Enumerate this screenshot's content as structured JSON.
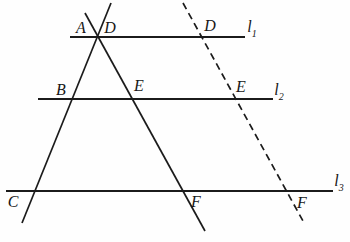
{
  "figure": {
    "type": "geometry-diagram",
    "background": "#fefefe",
    "stroke_color": "#1b1b1b",
    "dash_pattern": "7,4.5",
    "width": 350,
    "height": 242,
    "lines": [
      {
        "name": "line-l1",
        "x1": 70,
        "y1": 37,
        "x2": 245,
        "y2": 37,
        "dashed": false,
        "stroke_width": 2
      },
      {
        "name": "line-l2",
        "x1": 38,
        "y1": 99,
        "x2": 273,
        "y2": 99,
        "dashed": false,
        "stroke_width": 2
      },
      {
        "name": "line-l3",
        "x1": 6,
        "y1": 191,
        "x2": 333,
        "y2": 191,
        "dashed": false,
        "stroke_width": 2
      },
      {
        "name": "transversal-a-b-c",
        "x1": 111,
        "y1": 3,
        "x2": 22,
        "y2": 223,
        "dashed": false,
        "stroke_width": 1.7
      },
      {
        "name": "transversal-a-e-f",
        "x1": 85,
        "y1": 13,
        "x2": 205,
        "y2": 231,
        "dashed": false,
        "stroke_width": 1.7
      },
      {
        "name": "transversal-d-e-f-dashed",
        "x1": 183,
        "y1": 3,
        "x2": 303,
        "y2": 221,
        "dashed": true,
        "stroke_width": 1.7
      }
    ],
    "point_labels": [
      {
        "name": "point-label-a",
        "text": "A",
        "x": 81,
        "y": 28
      },
      {
        "name": "point-label-d-left",
        "text": "D",
        "x": 110,
        "y": 28
      },
      {
        "name": "point-label-d-dashed",
        "text": "D",
        "x": 210,
        "y": 26
      },
      {
        "name": "point-label-b",
        "text": "B",
        "x": 61,
        "y": 90
      },
      {
        "name": "point-label-e-solid",
        "text": "E",
        "x": 139,
        "y": 86
      },
      {
        "name": "point-label-e-dashed",
        "text": "E",
        "x": 241,
        "y": 87
      },
      {
        "name": "point-label-c",
        "text": "C",
        "x": 13,
        "y": 202
      },
      {
        "name": "point-label-f-solid",
        "text": "F",
        "x": 196,
        "y": 202
      },
      {
        "name": "point-label-f-dashed",
        "text": "F",
        "x": 302,
        "y": 203
      }
    ],
    "line_labels": [
      {
        "name": "line-label-l1",
        "base": "l",
        "sub": "1",
        "x": 252,
        "y": 29
      },
      {
        "name": "line-label-l2",
        "base": "l",
        "sub": "2",
        "x": 279,
        "y": 92
      },
      {
        "name": "line-label-l3",
        "base": "l",
        "sub": "3",
        "x": 339,
        "y": 183
      }
    ]
  }
}
